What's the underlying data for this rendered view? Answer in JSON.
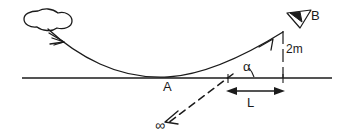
{
  "figure": {
    "type": "physics-diagram",
    "title": "",
    "background_color": "#ffffff",
    "stroke_color": "#1b1b1b",
    "width": 347,
    "height": 138
  },
  "labels": {
    "point_a": "A",
    "point_b": "B",
    "angle": "α",
    "horizontal_distance": "L",
    "height": "2m",
    "infinity": "∞"
  },
  "elements": {
    "cloud": "cloud-shape",
    "ground_line": "ground-line",
    "trajectory": "trajectory-curve",
    "incoming_arrow": "incoming-arrow",
    "launch_arrow": "launch-arrow",
    "eye_marker": "eye-icon",
    "height_line": "height-line",
    "angle_arc": "angle-arc",
    "length_arrow": "length-dimension-arrow",
    "sight_line": "dashed-sight-line",
    "infinity_arrow": "infinity-arrow"
  },
  "geometry": {
    "ground_y": 78,
    "ground_x_start": 22,
    "ground_x_end": 332,
    "point_a_x": 168,
    "point_b_x": 283,
    "point_b_y": 32,
    "angle_vertex_x": 228,
    "height_top_y": 32,
    "length_start_x": 228,
    "length_end_x": 283
  }
}
